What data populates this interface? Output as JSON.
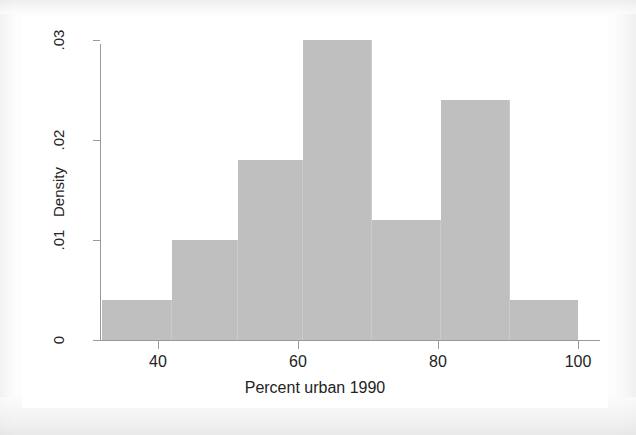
{
  "figure": {
    "background_color": "#ffffff",
    "page_background_color": "#fdfdfd",
    "bar_color": "#bfbfbf",
    "axis_color": "#9a9a9a",
    "text_color": "#232323"
  },
  "chart_data": {
    "type": "bar",
    "title": "",
    "subtitle": "",
    "xlabel": "Percent urban 1990",
    "ylabel": "Density",
    "xlim": [
      32,
      100
    ],
    "ylim": [
      0,
      0.03
    ],
    "grid": false,
    "legend": null,
    "xticks": [
      40,
      60,
      80,
      100
    ],
    "xtick_labels": [
      "40",
      "60",
      "80",
      "100"
    ],
    "yticks": [
      0,
      0.01,
      0.02,
      0.03
    ],
    "ytick_labels": [
      "0",
      ".01",
      ".02",
      ".03"
    ],
    "bin_edges": [
      32,
      42,
      51.4,
      60.7,
      70.6,
      80.4,
      90.3,
      100
    ],
    "bins": [
      {
        "x0": 32,
        "x1": 42,
        "value": 0.004
      },
      {
        "x0": 42,
        "x1": 51.4,
        "value": 0.01
      },
      {
        "x0": 51.4,
        "x1": 60.7,
        "value": 0.018
      },
      {
        "x0": 60.7,
        "x1": 70.6,
        "value": 0.03
      },
      {
        "x0": 70.6,
        "x1": 80.4,
        "value": 0.012
      },
      {
        "x0": 80.4,
        "x1": 90.3,
        "value": 0.024
      },
      {
        "x0": 90.3,
        "x1": 100,
        "value": 0.004
      }
    ],
    "values": [
      0.004,
      0.01,
      0.018,
      0.03,
      0.012,
      0.024,
      0.004
    ],
    "categories": [
      "32-42",
      "42-51.4",
      "51.4-60.7",
      "60.7-70.6",
      "70.6-80.4",
      "80.4-90.3",
      "90.3-100"
    ]
  }
}
